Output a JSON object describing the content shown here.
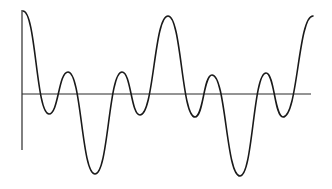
{
  "chart_data": {
    "type": "line",
    "title": "",
    "xlabel": "",
    "ylabel": "",
    "grid": false,
    "legend": null,
    "axes": {
      "vertical": {
        "x": 22,
        "y_top": 10,
        "y_bottom": 150
      },
      "horizontal": {
        "y": 94,
        "x_left": 22,
        "x_right": 311
      }
    },
    "x": [
      0,
      1,
      2,
      3,
      4,
      5,
      6,
      7,
      8,
      9,
      10,
      11,
      12
    ],
    "values": [
      1.0,
      -0.25,
      0.27,
      -1.0,
      0.27,
      -0.25,
      1.0,
      -0.28,
      0.23,
      -1.0,
      0.25,
      -0.28,
      0.95
    ],
    "key_points_px": [
      [
        23,
        11
      ],
      [
        49,
        114
      ],
      [
        68,
        72
      ],
      [
        95,
        174
      ],
      [
        122,
        72
      ],
      [
        140,
        115
      ],
      [
        168,
        16
      ],
      [
        195,
        117
      ],
      [
        212,
        75
      ],
      [
        240,
        176
      ],
      [
        266,
        73
      ],
      [
        283,
        117
      ],
      [
        313,
        16
      ]
    ],
    "colors": {
      "stroke": "#1a1a1a",
      "axis": "#2a2a2a",
      "background": "#ffffff"
    }
  }
}
